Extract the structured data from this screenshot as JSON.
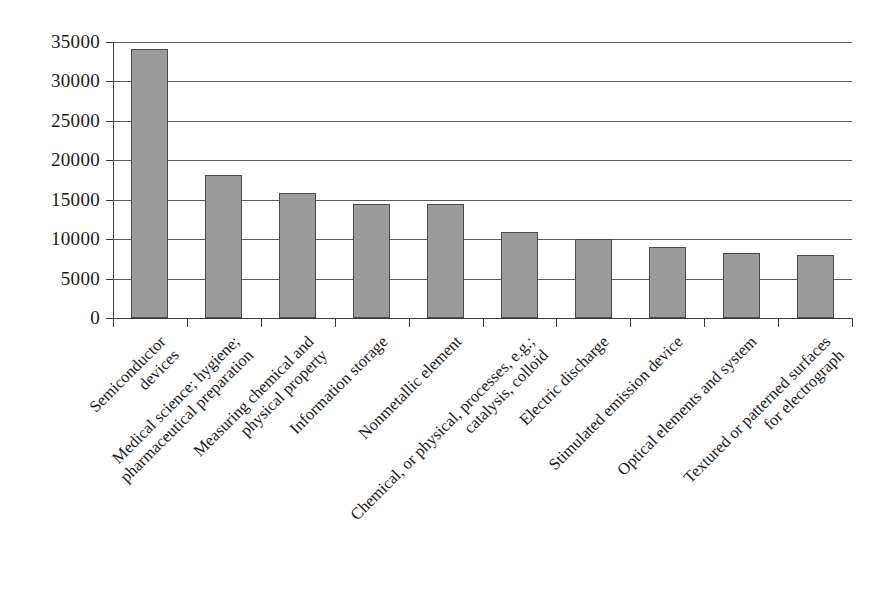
{
  "chart_data": {
    "type": "bar",
    "title": "",
    "subtitle": "",
    "xlabel": "",
    "ylabel": "",
    "ylim": [
      0,
      35000
    ],
    "ytick_values": [
      0,
      5000,
      10000,
      15000,
      20000,
      25000,
      30000,
      35000
    ],
    "ytick_labels": [
      "0",
      "5000",
      "10000",
      "15000",
      "20000",
      "25000",
      "30000",
      "35000"
    ],
    "grid": true,
    "legend": false,
    "legend_position": "none",
    "bar_color": "#9b9b9b",
    "bar_edge_color": "#4a4a4a",
    "axis_color": "#3a3a3a",
    "gridline_color": "#5a5a5a",
    "background_color": "#ffffff",
    "categories": [
      "Semiconductor devices",
      "Medical science; hygiene; pharmaceutical preparation",
      "Measuring chemical and physical property",
      "Information storage",
      "Nonmetallic element",
      "Chemical, or physical, processes, e.g.; catalysis, colloid",
      "Electric discharge",
      "Stimulated emission device",
      "Optical elements and system",
      "Textured or patterned surfaces for electrograph"
    ],
    "category_lines": [
      [
        "Semiconductor",
        "devices"
      ],
      [
        "Medical science; hygiene;",
        "pharmaceutical preparation"
      ],
      [
        "Measuring chemical and",
        "physical property"
      ],
      [
        "Information storage"
      ],
      [
        "Nonmetallic element"
      ],
      [
        "Chemical, or physical, processes, e.g.;",
        "catalysis, colloid"
      ],
      [
        "Electric discharge"
      ],
      [
        "Stimulated emission device"
      ],
      [
        "Optical elements and system"
      ],
      [
        "Textured or patterned surfaces",
        "for electrograph"
      ]
    ],
    "values": [
      34100,
      18100,
      15800,
      14400,
      14400,
      10900,
      10000,
      9000,
      8300,
      8000
    ]
  }
}
